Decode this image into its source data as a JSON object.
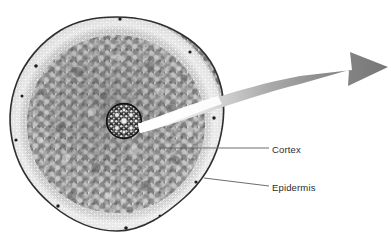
{
  "figure": {
    "kind": "micrograph-diagram",
    "background_color": "#ffffff",
    "width": 391,
    "height": 246
  },
  "specimen": {
    "name": "root-cross-section",
    "shape": "circle",
    "center_x": 116,
    "center_y": 124,
    "radius_x": 106,
    "radius_y": 107,
    "body_color": "#9a9a9a",
    "rim_color": "#3a3a3a",
    "regions": [
      {
        "name": "epidermis",
        "description": "outer ring of small light cells",
        "color": "#d8d8d8"
      },
      {
        "name": "cortex",
        "description": "broad mottled parenchyma zone",
        "color": "#8f8f8f"
      },
      {
        "name": "stele",
        "description": "dark central vascular cylinder",
        "color": "#2e2e2e",
        "center_x": 124,
        "center_y": 121,
        "radius": 17
      }
    ]
  },
  "labels": [
    {
      "id": "cortex",
      "text": "Cortex",
      "color": "#2b2b2b",
      "leader": {
        "x1": 161,
        "y1": 148,
        "x2": 269,
        "y2": 148,
        "color": "#6d6d6d"
      }
    },
    {
      "id": "epidermis",
      "text": "Epidermis",
      "color": "#2b2b2b",
      "leader": {
        "x1": 204,
        "y1": 178,
        "x2": 269,
        "y2": 186,
        "color": "#6d6d6d"
      }
    }
  ],
  "callout_arrow": {
    "name": "magnification-arrow",
    "description": "curved tapering arrow sweeping from the stele out to the right edge",
    "tail_color": "#ffffff",
    "head_color": "#7f7f7f",
    "gradient_from": "#f2f2f2",
    "gradient_to": "#6f6f6f",
    "tip_x": 388,
    "tip_y": 67
  }
}
